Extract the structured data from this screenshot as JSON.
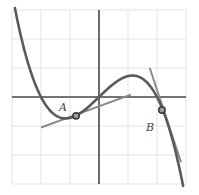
{
  "diagram": {
    "title": "",
    "colors": {
      "background": "#ffffff",
      "grid": "#e3e3e3",
      "axes": "#4a4a4a",
      "curve": "#5a5a5a",
      "tangent": "#8a8a8a",
      "point_stroke": "#3a3a3a",
      "point_fill": "#9a9a9a"
    },
    "grid": {
      "origin_px": [
        99,
        97
      ],
      "unit_px": 29,
      "x_range": [
        -3,
        3
      ],
      "y_range": [
        -3,
        3
      ]
    },
    "curve": {
      "description": "cubic function with zeros at x=-2, 0, 2",
      "formula": "y = -0.24 x (x^2 - 4)"
    },
    "points": [
      {
        "label": "A",
        "x": -0.79,
        "y": -0.65,
        "label_px": [
          59,
          111
        ]
      },
      {
        "label": "B",
        "x": 2.17,
        "y": -0.45,
        "label_px": [
          146,
          131
        ]
      }
    ],
    "tangents": [
      {
        "at": "A",
        "from": [
          -2.0,
          -1.05
        ],
        "to": [
          1.1,
          0.08
        ]
      },
      {
        "at": "B",
        "from": [
          1.75,
          1.0
        ],
        "to": [
          2.83,
          -2.25
        ]
      }
    ]
  }
}
